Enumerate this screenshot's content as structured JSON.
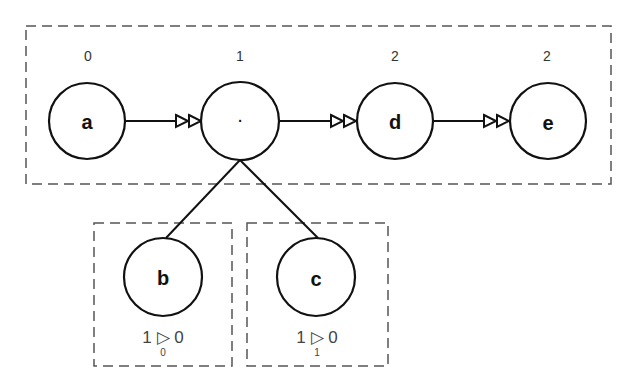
{
  "diagram": {
    "groups": [
      {
        "id": "main",
        "x": 26,
        "y": 26,
        "w": 585,
        "h": 158
      },
      {
        "id": "b-group",
        "x": 94,
        "y": 223,
        "w": 138,
        "h": 143
      },
      {
        "id": "c-group",
        "x": 247,
        "y": 223,
        "w": 141,
        "h": 143
      }
    ],
    "nodes": [
      {
        "id": "a",
        "label": "a",
        "cx": 87,
        "cy": 121,
        "r": 38,
        "level": "0"
      },
      {
        "id": "dot",
        "label": "·",
        "cx": 240,
        "cy": 121,
        "r": 39,
        "level": "1"
      },
      {
        "id": "d",
        "label": "d",
        "cx": 395,
        "cy": 121,
        "r": 38,
        "level": "2"
      },
      {
        "id": "e",
        "label": "e",
        "cx": 548,
        "cy": 121,
        "r": 38,
        "level": "2"
      },
      {
        "id": "b",
        "label": "b",
        "cx": 163,
        "cy": 277,
        "r": 39
      },
      {
        "id": "c",
        "label": "c",
        "cx": 316,
        "cy": 277,
        "r": 39
      }
    ],
    "edges": [
      {
        "from": "a",
        "to": "dot",
        "type": "double-arrow"
      },
      {
        "from": "dot",
        "to": "d",
        "type": "double-arrow"
      },
      {
        "from": "d",
        "to": "e",
        "type": "double-arrow"
      },
      {
        "from": "dot",
        "to": "b",
        "type": "line"
      },
      {
        "from": "dot",
        "to": "c",
        "type": "line"
      }
    ],
    "b_annotation": {
      "left": "1",
      "symbol": "▷",
      "right": "0",
      "sub": "0"
    },
    "c_annotation": {
      "left": "1",
      "symbol": "▷",
      "right": "0",
      "sub": "1"
    }
  },
  "colors": {
    "stroke": "#111111",
    "dash": "#555555"
  }
}
